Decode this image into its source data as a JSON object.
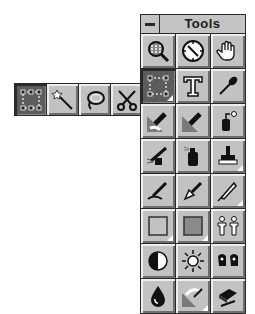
{
  "palette": {
    "title": "Tools",
    "system_menu_icon": "minus-icon",
    "tools": [
      {
        "name": "zoom",
        "icon": "magnifier-icon",
        "selected": false,
        "has_flyout": false
      },
      {
        "name": "measure",
        "icon": "compass-icon",
        "selected": false,
        "has_flyout": false
      },
      {
        "name": "hand",
        "icon": "hand-icon",
        "selected": false,
        "has_flyout": false
      },
      {
        "name": "rectangle-select",
        "icon": "marquee-icon",
        "selected": true,
        "has_flyout": true
      },
      {
        "name": "text",
        "icon": "text-t-icon",
        "selected": false,
        "has_flyout": false
      },
      {
        "name": "eyedropper",
        "icon": "eyedropper-icon",
        "selected": false,
        "has_flyout": false
      },
      {
        "name": "brush",
        "icon": "paintbrush-icon",
        "selected": false,
        "has_flyout": false
      },
      {
        "name": "fill-brush",
        "icon": "fill-brush-icon",
        "selected": false,
        "has_flyout": false
      },
      {
        "name": "paint-bucket",
        "icon": "bucket-icon",
        "selected": false,
        "has_flyout": false
      },
      {
        "name": "airbrush",
        "icon": "airbrush-icon",
        "selected": false,
        "has_flyout": false
      },
      {
        "name": "spray-can",
        "icon": "spraycan-icon",
        "selected": false,
        "has_flyout": false
      },
      {
        "name": "rubber-stamp",
        "icon": "stamp-icon",
        "selected": false,
        "has_flyout": true
      },
      {
        "name": "calligraphy",
        "icon": "calligraphy-pen-icon",
        "selected": false,
        "has_flyout": false
      },
      {
        "name": "pen",
        "icon": "pen-nib-icon",
        "selected": false,
        "has_flyout": false
      },
      {
        "name": "bezier",
        "icon": "quill-icon",
        "selected": false,
        "has_flyout": true
      },
      {
        "name": "hollow-rectangle",
        "icon": "rectangle-outline-icon",
        "selected": false,
        "has_flyout": true
      },
      {
        "name": "filled-rectangle",
        "icon": "rectangle-filled-icon",
        "selected": false,
        "has_flyout": true
      },
      {
        "name": "pattern",
        "icon": "paper-dolls-icon",
        "selected": false,
        "has_flyout": false
      },
      {
        "name": "contrast",
        "icon": "contrast-circle-icon",
        "selected": false,
        "has_flyout": false
      },
      {
        "name": "brightness",
        "icon": "sun-icon",
        "selected": false,
        "has_flyout": false
      },
      {
        "name": "effects",
        "icon": "gloves-icon",
        "selected": false,
        "has_flyout": false
      },
      {
        "name": "blur",
        "icon": "water-drop-icon",
        "selected": false,
        "has_flyout": false
      },
      {
        "name": "smudge",
        "icon": "smudge-icon",
        "selected": false,
        "has_flyout": true
      },
      {
        "name": "eraser",
        "icon": "eraser-icon",
        "selected": false,
        "has_flyout": false
      }
    ]
  },
  "flyout": {
    "tools": [
      {
        "name": "rectangle-select",
        "icon": "marquee-icon",
        "selected": true
      },
      {
        "name": "magic-wand",
        "icon": "magic-wand-icon",
        "selected": false
      },
      {
        "name": "lasso",
        "icon": "lasso-icon",
        "selected": false
      },
      {
        "name": "scissors",
        "icon": "scissors-icon",
        "selected": false
      }
    ]
  }
}
